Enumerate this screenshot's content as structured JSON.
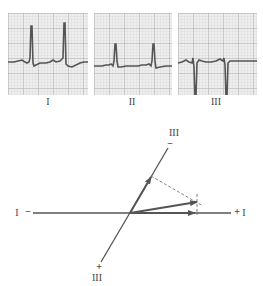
{
  "ecg_strips": [
    {
      "lead": "I",
      "label": "I",
      "morphology": "tall positive R wave"
    },
    {
      "lead": "II",
      "label": "II",
      "morphology": "moderate positive R wave"
    },
    {
      "lead": "III",
      "label": "III",
      "morphology": "deep negative S wave"
    }
  ],
  "vector_diagram": {
    "lead_I_axis": {
      "negative_label": "I",
      "negative_sign": "−",
      "positive_sign": "+",
      "positive_label": "I"
    },
    "lead_III_axis": {
      "negative_label": "III",
      "negative_sign": "−",
      "positive_sign": "+",
      "positive_label": "III"
    },
    "vectors": [
      "lead I projection",
      "lead III projection",
      "resultant"
    ]
  },
  "colors": {
    "grid_bg": "#eeeeee",
    "grid_minor": "#c8c8c8",
    "grid_major": "#9a9a9a",
    "trace": "#555555",
    "axis": "#555555"
  }
}
